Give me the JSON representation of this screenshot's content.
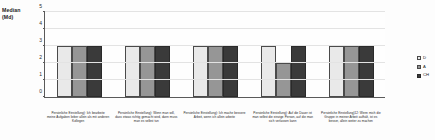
{
  "chart_data": {
    "type": "bar",
    "title": "",
    "xlabel": "",
    "ylabel": "Median (Md)",
    "ylabel_line1": "Median",
    "ylabel_line2": "(Md)",
    "ylim": [
      0,
      5
    ],
    "yticks": [
      0,
      1,
      2,
      3,
      4,
      5
    ],
    "grid": true,
    "legend_position": "right",
    "categories": [
      "Persönliche Einstellung): Ich bearbeite meine Aufgaben lieber allein als mit anderen Kollegen",
      "Persönliche Einstellung): Wenn man will, dass etwas richtig gemacht wird, dann muss man es selbst tun",
      "Persönliche Einstellung): Ich mache bessere Arbeit, wenn ich allein arbeite",
      "Persönliche Einstellung): Auf die Dauer ist man selbst die einzige Person, auf die man sich verlassen kann",
      "Persönliche Einstellung)12: Wenn mich die Gruppe in meiner Arbeit aufhält, ist es besser, allein weiter zu machen"
    ],
    "series": [
      {
        "name": "D",
        "color": "#e9e9e9",
        "values": [
          3,
          3,
          3,
          3,
          3
        ]
      },
      {
        "name": "A",
        "color": "#969696",
        "values": [
          3,
          3,
          3,
          2,
          3
        ]
      },
      {
        "name": "CH",
        "color": "#3a3a3a",
        "values": [
          3,
          3,
          3,
          3,
          3
        ]
      }
    ]
  }
}
